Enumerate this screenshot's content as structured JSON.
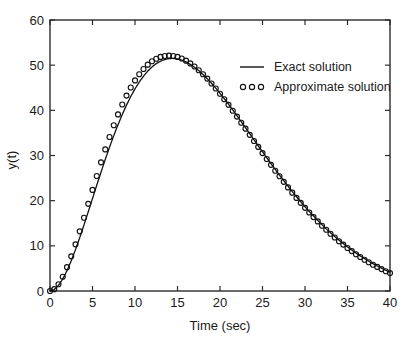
{
  "chart_data": {
    "type": "line",
    "title": "",
    "xlabel": "Time (sec)",
    "ylabel": "y(t)",
    "xlim": [
      0,
      40
    ],
    "ylim": [
      0,
      60
    ],
    "xticks": [
      0,
      5,
      10,
      15,
      20,
      25,
      30,
      35,
      40
    ],
    "yticks": [
      0,
      10,
      20,
      30,
      40,
      50,
      60
    ],
    "xtick_labels": [
      "0",
      "5",
      "10",
      "15",
      "20",
      "25",
      "30",
      "35",
      "40"
    ],
    "ytick_labels": [
      "0",
      "10",
      "20",
      "30",
      "40",
      "50",
      "60"
    ],
    "grid": false,
    "legend_position": "upper right",
    "legend": [
      {
        "label": "Exact solution",
        "marker": "line"
      },
      {
        "label": "Approximate solution",
        "marker": "circles"
      }
    ],
    "series": [
      {
        "name": "Exact solution",
        "style": "solid-line",
        "x": [
          0,
          0.5,
          1,
          1.5,
          2,
          2.5,
          3,
          3.5,
          4,
          4.5,
          5,
          5.5,
          6,
          6.5,
          7,
          7.5,
          8,
          8.5,
          9,
          9.5,
          10,
          10.5,
          11,
          11.5,
          12,
          12.5,
          13,
          13.5,
          14,
          14.5,
          15,
          15.5,
          16,
          16.5,
          17,
          17.5,
          18,
          18.5,
          19,
          19.5,
          20,
          20.5,
          21,
          21.5,
          22,
          22.5,
          23,
          23.5,
          24,
          24.5,
          25,
          25.5,
          26,
          26.5,
          27,
          27.5,
          28,
          28.5,
          29,
          29.5,
          30,
          30.5,
          31,
          31.5,
          32,
          32.5,
          33,
          33.5,
          34,
          34.5,
          35,
          35.5,
          36,
          36.5,
          37,
          37.5,
          38,
          38.5,
          39,
          39.5,
          40
        ],
        "y": [
          0.0,
          0.24,
          0.91,
          1.95,
          3.3,
          4.9,
          6.71,
          8.66,
          10.72,
          12.85,
          15.0,
          17.15,
          19.27,
          21.33,
          23.31,
          25.2,
          26.97,
          28.63,
          30.15,
          31.54,
          32.79,
          33.89,
          34.85,
          35.67,
          36.34,
          36.88,
          37.28,
          37.55,
          37.7,
          37.73,
          37.64,
          37.45,
          37.16,
          36.77,
          36.3,
          35.75,
          35.13,
          34.44,
          33.7,
          32.91,
          32.07,
          31.2,
          30.3,
          29.37,
          28.42,
          27.46,
          26.49,
          25.51,
          24.53,
          23.55,
          22.58,
          21.61,
          20.66,
          19.72,
          18.79,
          17.89,
          17.0,
          16.13,
          15.29,
          14.47,
          13.67,
          12.9,
          12.16,
          11.44,
          10.75,
          10.08,
          9.45,
          8.83,
          8.25,
          7.69,
          7.15,
          6.64,
          6.15,
          5.69,
          5.25,
          4.83,
          4.43,
          4.06,
          3.7,
          3.37,
          3.05
        ]
      },
      {
        "name": "Approximate solution",
        "style": "open-circles",
        "x": [
          0,
          0.5,
          1,
          1.5,
          2,
          2.5,
          3,
          3.5,
          4,
          4.5,
          5,
          5.5,
          6,
          6.5,
          7,
          7.5,
          8,
          8.5,
          9,
          9.5,
          10,
          10.5,
          11,
          11.5,
          12,
          12.5,
          13,
          13.5,
          14,
          14.5,
          15,
          15.5,
          16,
          16.5,
          17,
          17.5,
          18,
          18.5,
          19,
          19.5,
          20,
          20.5,
          21,
          21.5,
          22,
          22.5,
          23,
          23.5,
          24,
          24.5,
          25,
          25.5,
          26,
          26.5,
          27,
          27.5,
          28,
          28.5,
          29,
          29.5,
          30,
          30.5,
          31,
          31.5,
          32,
          32.5,
          33,
          33.5,
          34,
          34.5,
          35,
          35.5,
          36,
          36.5,
          37,
          37.5,
          38,
          38.5,
          39,
          39.5,
          40
        ],
        "y": [
          0.0,
          0.3,
          1.1,
          2.3,
          3.85,
          5.6,
          7.55,
          9.65,
          11.85,
          14.1,
          16.35,
          18.6,
          20.8,
          22.9,
          24.9,
          26.8,
          28.55,
          30.15,
          31.6,
          32.9,
          34.05,
          35.05,
          35.9,
          36.6,
          37.15,
          37.55,
          37.85,
          38.0,
          38.05,
          38.0,
          37.85,
          37.6,
          37.25,
          36.8,
          36.3,
          35.7,
          35.05,
          34.35,
          33.55,
          32.75,
          31.9,
          31.0,
          30.1,
          29.15,
          28.2,
          27.2,
          26.25,
          25.25,
          24.25,
          23.3,
          22.3,
          21.35,
          20.4,
          19.45,
          18.55,
          17.65,
          16.75,
          15.9,
          15.05,
          14.25,
          13.45,
          12.7,
          11.95,
          11.25,
          10.55,
          9.9,
          9.25,
          8.65,
          8.05,
          7.5,
          6.95,
          6.45,
          5.95,
          5.5,
          5.05,
          4.65,
          4.25,
          3.9,
          3.55,
          3.2,
          2.9
        ]
      }
    ],
    "peak": {
      "x": 15,
      "y": 51.5
    },
    "end_value": {
      "x": 40,
      "y": 6
    }
  }
}
